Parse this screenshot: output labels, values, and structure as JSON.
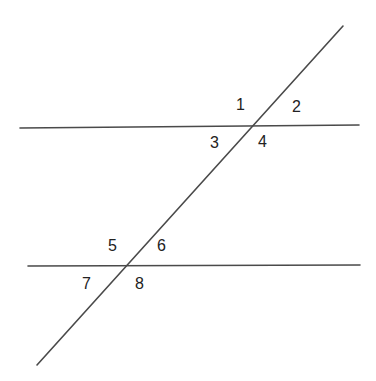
{
  "diagram": {
    "type": "parallel-lines-cut-by-transversal",
    "line_color": "#4a4a4a",
    "label_color": "#222222",
    "lines": [
      {
        "id": "parallel-line-top",
        "x1": 20,
        "y1": 128,
        "x2": 359,
        "y2": 125
      },
      {
        "id": "parallel-line-bottom",
        "x1": 28,
        "y1": 266,
        "x2": 360,
        "y2": 265
      },
      {
        "id": "transversal",
        "x1": 343,
        "y1": 26,
        "x2": 37,
        "y2": 365
      }
    ],
    "angle_labels": [
      {
        "text": "1",
        "x": 236,
        "y": 110
      },
      {
        "text": "2",
        "x": 292,
        "y": 112
      },
      {
        "text": "3",
        "x": 210,
        "y": 148
      },
      {
        "text": "4",
        "x": 258,
        "y": 147
      },
      {
        "text": "5",
        "x": 108,
        "y": 251
      },
      {
        "text": "6",
        "x": 157,
        "y": 251
      },
      {
        "text": "7",
        "x": 82,
        "y": 289
      },
      {
        "text": "8",
        "x": 135,
        "y": 289
      }
    ]
  }
}
